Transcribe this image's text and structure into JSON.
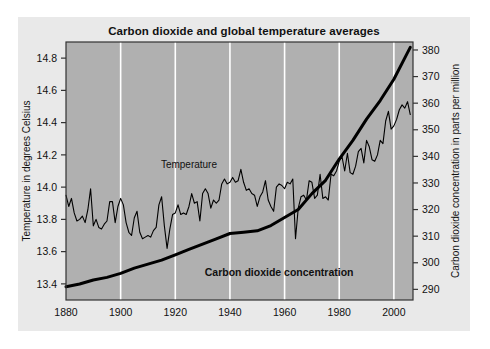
{
  "figure": {
    "title": "Carbon dioxide and global temperature averages",
    "background_color": "#e9e9e9",
    "plot_background_color": "#b0b0b0",
    "gridline_color": "#ffffff",
    "axis_color": "#333333",
    "series_color": "#000000"
  },
  "chart_data": {
    "type": "line",
    "title": "Carbon dioxide and global temperature averages",
    "xlabel": "",
    "ylabel": "Temperature  in degrees Celsius",
    "y2label": "Carbon dioxide concentration in parts per million",
    "xlim": [
      1880,
      2007
    ],
    "ylim": [
      13.3,
      14.9
    ],
    "y2lim": [
      286,
      383
    ],
    "xticks": [
      1880,
      1900,
      1920,
      1940,
      1960,
      1980,
      2000
    ],
    "yticks": [
      13.4,
      13.6,
      13.8,
      14.0,
      14.2,
      14.4,
      14.6,
      14.8
    ],
    "y2ticks": [
      290,
      300,
      310,
      320,
      330,
      340,
      350,
      360,
      370,
      380
    ],
    "grid": "vertical",
    "legend": "inline-annotations",
    "annotations": [
      {
        "text": "Temperature",
        "x": 1925,
        "y": 14.12,
        "bold": false
      },
      {
        "text": "Carbon dioxide concentration",
        "x": 1958,
        "y": 13.45,
        "bold": true
      }
    ],
    "series": [
      {
        "name": "Temperature",
        "axis": "left",
        "units": "degrees Celsius",
        "x": [
          1880,
          1881,
          1882,
          1883,
          1884,
          1885,
          1886,
          1887,
          1888,
          1889,
          1890,
          1891,
          1892,
          1893,
          1894,
          1895,
          1896,
          1897,
          1898,
          1899,
          1900,
          1901,
          1902,
          1903,
          1904,
          1905,
          1906,
          1907,
          1908,
          1909,
          1910,
          1911,
          1912,
          1913,
          1914,
          1915,
          1916,
          1917,
          1918,
          1919,
          1920,
          1921,
          1922,
          1923,
          1924,
          1925,
          1926,
          1927,
          1928,
          1929,
          1930,
          1931,
          1932,
          1933,
          1934,
          1935,
          1936,
          1937,
          1938,
          1939,
          1940,
          1941,
          1942,
          1943,
          1944,
          1945,
          1946,
          1947,
          1948,
          1949,
          1950,
          1951,
          1952,
          1953,
          1954,
          1955,
          1956,
          1957,
          1958,
          1959,
          1960,
          1961,
          1962,
          1963,
          1964,
          1965,
          1966,
          1967,
          1968,
          1969,
          1970,
          1971,
          1972,
          1973,
          1974,
          1975,
          1976,
          1977,
          1978,
          1979,
          1980,
          1981,
          1982,
          1983,
          1984,
          1985,
          1986,
          1987,
          1988,
          1989,
          1990,
          1991,
          1992,
          1993,
          1994,
          1995,
          1996,
          1997,
          1998,
          1999,
          2000,
          2001,
          2002,
          2003,
          2004,
          2005,
          2006
        ],
        "values": [
          13.95,
          13.88,
          13.93,
          13.84,
          13.79,
          13.8,
          13.82,
          13.78,
          13.86,
          13.99,
          13.76,
          13.8,
          13.75,
          13.74,
          13.77,
          13.79,
          13.91,
          13.91,
          13.78,
          13.88,
          13.93,
          13.89,
          13.78,
          13.72,
          13.7,
          13.81,
          13.85,
          13.72,
          13.68,
          13.69,
          13.7,
          13.69,
          13.73,
          13.75,
          13.89,
          13.94,
          13.76,
          13.62,
          13.74,
          13.83,
          13.84,
          13.89,
          13.83,
          13.84,
          13.83,
          13.88,
          13.96,
          13.9,
          13.91,
          13.79,
          13.96,
          13.99,
          13.96,
          13.87,
          13.92,
          13.9,
          13.92,
          14.02,
          14.05,
          14.02,
          14.03,
          14.06,
          14.03,
          14.04,
          14.11,
          14.03,
          13.98,
          13.99,
          13.96,
          13.95,
          13.88,
          13.94,
          13.97,
          14.04,
          13.92,
          13.88,
          13.85,
          14.0,
          14.02,
          14.01,
          13.99,
          14.03,
          14.02,
          14.05,
          13.68,
          13.87,
          13.94,
          13.95,
          13.92,
          14.04,
          14.03,
          13.93,
          13.95,
          14.08,
          13.93,
          13.94,
          13.92,
          14.08,
          14.07,
          14.1,
          14.16,
          14.19,
          14.1,
          14.21,
          14.09,
          14.08,
          14.13,
          14.22,
          14.24,
          14.15,
          14.29,
          14.25,
          14.17,
          14.16,
          14.2,
          14.29,
          14.27,
          14.41,
          14.47,
          14.36,
          14.38,
          14.42,
          14.48,
          14.51,
          14.49,
          14.53,
          14.45
        ]
      },
      {
        "name": "Carbon dioxide concentration",
        "axis": "right",
        "units": "parts per million",
        "x": [
          1880,
          1885,
          1890,
          1895,
          1900,
          1905,
          1910,
          1915,
          1920,
          1925,
          1930,
          1935,
          1940,
          1945,
          1950,
          1955,
          1960,
          1965,
          1970,
          1975,
          1980,
          1985,
          1990,
          1995,
          2000,
          2005,
          2006
        ],
        "values": [
          291,
          292,
          293.5,
          294.5,
          296,
          298,
          299.5,
          301,
          303,
          305,
          307,
          309,
          311,
          311.5,
          312,
          314,
          317,
          320,
          326,
          331,
          339,
          346,
          354,
          361,
          369,
          379,
          381
        ]
      }
    ]
  }
}
